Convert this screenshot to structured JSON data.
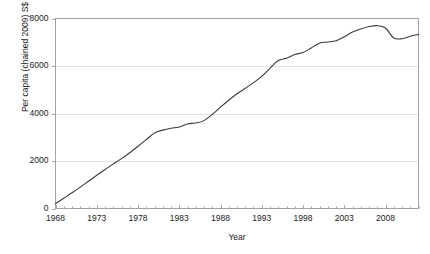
{
  "figure": {
    "clipped_caption": "",
    "background_color": "#ffffff",
    "axis_color": "#9a9a9a",
    "grid_color": "#d9d9d9",
    "line_color": "#3a3a3a"
  },
  "chart_data": {
    "type": "line",
    "title": "",
    "xlabel": "Year",
    "ylabel": "Per capita (chained 2009) S$",
    "xlim": [
      1968,
      2012
    ],
    "ylim": [
      0,
      8000
    ],
    "ytick_labels": [
      "0",
      "2000",
      "4000",
      "6000",
      "8000"
    ],
    "yticks": [
      0,
      2000,
      4000,
      6000,
      8000
    ],
    "xtick_labels": [
      "1968",
      "1973",
      "1978",
      "1983",
      "1988",
      "1993",
      "1998",
      "2003",
      "2008"
    ],
    "xticks": [
      1968,
      1973,
      1978,
      1983,
      1988,
      1993,
      1998,
      2003,
      2008
    ],
    "minor_xtick_interval": 1,
    "grid": "horizontal",
    "legend": "none",
    "x": [
      1968,
      1969,
      1970,
      1971,
      1972,
      1973,
      1974,
      1975,
      1976,
      1977,
      1978,
      1979,
      1980,
      1981,
      1982,
      1983,
      1984,
      1985,
      1986,
      1987,
      1988,
      1989,
      1990,
      1991,
      1992,
      1993,
      1994,
      1995,
      1996,
      1997,
      1998,
      1999,
      2000,
      2001,
      2002,
      2003,
      2004,
      2005,
      2006,
      2007,
      2008,
      2009,
      2010,
      2011,
      2012
    ],
    "values": [
      200,
      430,
      660,
      900,
      1150,
      1400,
      1640,
      1870,
      2100,
      2350,
      2620,
      2900,
      3180,
      3300,
      3380,
      3430,
      3560,
      3600,
      3700,
      3960,
      4270,
      4560,
      4830,
      5060,
      5300,
      5560,
      5900,
      6230,
      6330,
      6480,
      6570,
      6760,
      6960,
      7010,
      7060,
      7230,
      7430,
      7560,
      7660,
      7700,
      7600,
      7180,
      7150,
      7250,
      7330
    ]
  }
}
